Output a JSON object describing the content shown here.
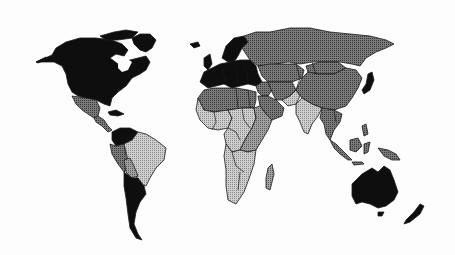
{
  "map": {
    "title": "",
    "type": "choropleth",
    "legend": [],
    "classes": {
      "black": {
        "color": "#0e0e0e",
        "pattern": "solid"
      },
      "dark": {
        "color": "#6b6b6b",
        "pattern": "dots-dense"
      },
      "medium": {
        "color": "#8d8d8d",
        "pattern": "dots"
      },
      "light": {
        "color": "#b9b9b9",
        "pattern": "dots-light"
      }
    },
    "regions": [
      {
        "name": "north-america",
        "class": "black"
      },
      {
        "name": "greenland",
        "class": "black"
      },
      {
        "name": "mexico",
        "class": "dark"
      },
      {
        "name": "central-america",
        "class": "dark"
      },
      {
        "name": "caribbean",
        "class": "black"
      },
      {
        "name": "venezuela-colombia",
        "class": "black"
      },
      {
        "name": "peru-ecuador",
        "class": "dark"
      },
      {
        "name": "brazil",
        "class": "light"
      },
      {
        "name": "bolivia",
        "class": "medium"
      },
      {
        "name": "argentina-chile",
        "class": "black"
      },
      {
        "name": "europe",
        "class": "black"
      },
      {
        "name": "scandinavia",
        "class": "black"
      },
      {
        "name": "iceland",
        "class": "black"
      },
      {
        "name": "uk-ireland",
        "class": "black"
      },
      {
        "name": "russia",
        "class": "dark"
      },
      {
        "name": "central-asia",
        "class": "dark"
      },
      {
        "name": "mongolia",
        "class": "dark"
      },
      {
        "name": "china",
        "class": "dark"
      },
      {
        "name": "middle-east",
        "class": "dark"
      },
      {
        "name": "saudi-arabia",
        "class": "dark"
      },
      {
        "name": "iran-afghanistan",
        "class": "dark"
      },
      {
        "name": "pakistan",
        "class": "light"
      },
      {
        "name": "india",
        "class": "light"
      },
      {
        "name": "southeast-asia",
        "class": "dark"
      },
      {
        "name": "japan",
        "class": "black"
      },
      {
        "name": "indonesia",
        "class": "dark"
      },
      {
        "name": "new-guinea",
        "class": "dark"
      },
      {
        "name": "north-africa",
        "class": "dark"
      },
      {
        "name": "west-africa",
        "class": "light"
      },
      {
        "name": "central-africa",
        "class": "light"
      },
      {
        "name": "east-africa",
        "class": "medium"
      },
      {
        "name": "southern-africa",
        "class": "light"
      },
      {
        "name": "madagascar",
        "class": "medium"
      },
      {
        "name": "australia",
        "class": "black"
      },
      {
        "name": "new-zealand",
        "class": "black"
      }
    ]
  }
}
